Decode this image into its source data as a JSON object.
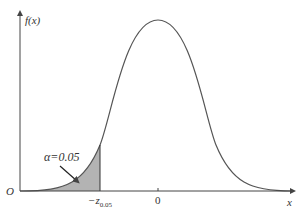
{
  "diagram": {
    "y_axis_label": "f(x)",
    "x_axis_label": "x",
    "origin_label": "O",
    "zero_tick_label": "0",
    "critical_value_label": "−z",
    "critical_value_subscript": "0.05",
    "alpha_label": "α=0.05",
    "colors": {
      "curve": "#555555",
      "axis": "#444444",
      "shade": "#b3b3b3"
    }
  }
}
